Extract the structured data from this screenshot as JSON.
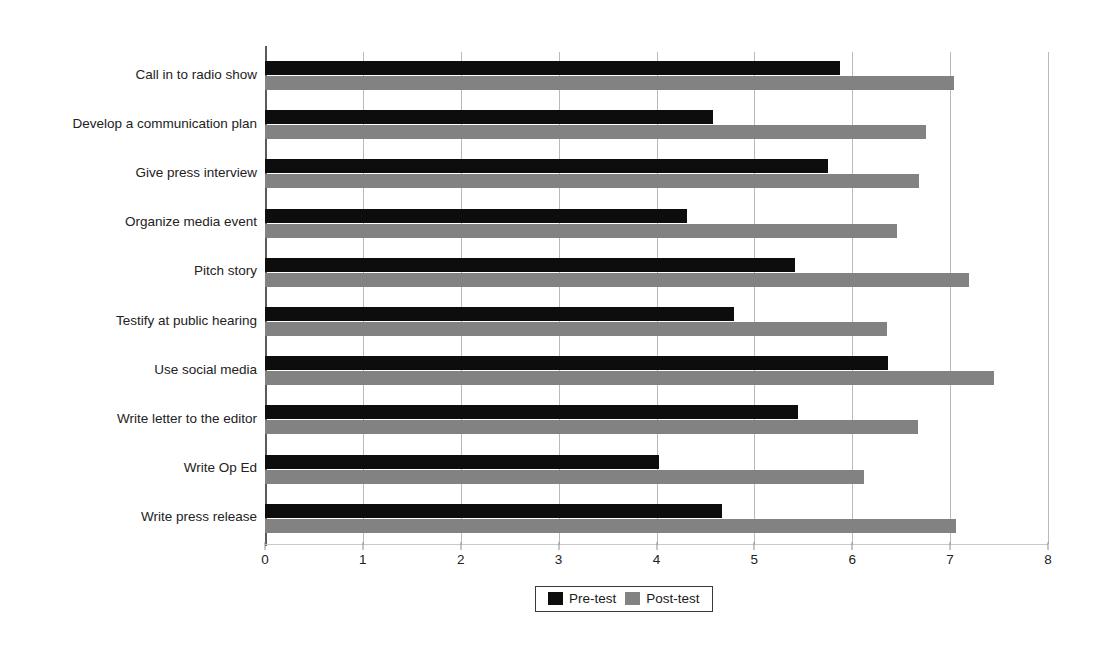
{
  "chart_data": {
    "type": "bar",
    "orientation": "horizontal",
    "title": "",
    "xlabel": "",
    "ylabel": "",
    "xlim": [
      0,
      8
    ],
    "xticks": [
      0,
      1,
      2,
      3,
      4,
      5,
      6,
      7,
      8
    ],
    "xtick_labels": [
      "0",
      "1",
      "2",
      "3",
      "4",
      "5",
      "6",
      "7",
      "8"
    ],
    "grid": "vertical",
    "legend_position": "bottom-center",
    "categories": [
      "Call in to radio show",
      "Develop a communication plan",
      "Give press interview",
      "Organize media event",
      "Pitch story",
      "Testify at public hearing",
      "Use social media",
      "Write letter to the editor",
      "Write Op Ed",
      "Write press release"
    ],
    "series": [
      {
        "name": "Pre-test",
        "color": "#0d0d0d",
        "values": [
          5.87,
          4.58,
          5.75,
          4.31,
          5.41,
          4.79,
          6.37,
          5.45,
          4.03,
          4.67
        ]
      },
      {
        "name": "Post-test",
        "color": "#828282",
        "values": [
          7.04,
          6.75,
          6.68,
          6.46,
          7.19,
          6.35,
          7.45,
          6.67,
          6.12,
          7.06
        ]
      }
    ]
  },
  "legend": {
    "items": [
      {
        "label": "Pre-test",
        "color": "#0d0d0d"
      },
      {
        "label": "Post-test",
        "color": "#828282"
      }
    ]
  }
}
